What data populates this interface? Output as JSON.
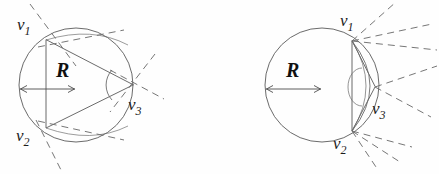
{
  "figure": {
    "name": "circumscribed-circle-vertex-diagrams",
    "background_color": "#fefefe",
    "line_color": "#5a5a5a",
    "label_color": "#1c1c1c",
    "panel_count": 2
  },
  "left_panel": {
    "name": "left-diagram",
    "circle": {
      "cx": 76,
      "cy": 85,
      "r": 57
    },
    "radius_label": "R",
    "vertices": [
      {
        "id": "v1",
        "base": "v",
        "sub": "1",
        "x": 46,
        "y": 40,
        "label_x": 17,
        "label_y": 16
      },
      {
        "id": "v2",
        "base": "v",
        "sub": "2",
        "x": 46,
        "y": 128,
        "label_x": 16,
        "label_y": 127
      },
      {
        "id": "v3",
        "base": "v",
        "sub": "3",
        "x": 133,
        "y": 85,
        "label_x": 128,
        "label_y": 96
      }
    ]
  },
  "right_panel": {
    "name": "right-diagram",
    "circle": {
      "cx": 322,
      "cy": 85,
      "r": 57
    },
    "radius_label": "R",
    "vertices": [
      {
        "id": "v1",
        "base": "v",
        "sub": "1",
        "x": 352,
        "y": 41,
        "label_x": 340,
        "label_y": 12
      },
      {
        "id": "v2",
        "base": "v",
        "sub": "2",
        "x": 352,
        "y": 131,
        "label_x": 333,
        "label_y": 135
      },
      {
        "id": "v3",
        "base": "v",
        "sub": "3",
        "x": 375,
        "y": 87,
        "label_x": 372,
        "label_y": 100
      }
    ]
  }
}
